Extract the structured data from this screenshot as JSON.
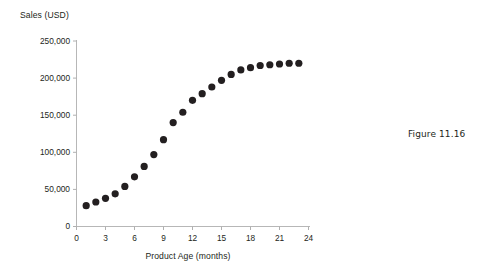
{
  "figure": {
    "caption": "Figure 11.16"
  },
  "chart_data": {
    "type": "scatter",
    "title": "",
    "subtitle": "",
    "xlabel": "Product Age (months)",
    "ylabel": "Sales (USD)",
    "xlim": [
      0,
      24
    ],
    "ylim": [
      0,
      250000
    ],
    "xticks": [
      0,
      3,
      6,
      9,
      12,
      15,
      18,
      21,
      24
    ],
    "xtick_labels": [
      "0",
      "3",
      "6",
      "9",
      "12",
      "15",
      "18",
      "21",
      "24"
    ],
    "yticks": [
      0,
      50000,
      100000,
      150000,
      200000,
      250000
    ],
    "ytick_labels": [
      "0",
      "50,000",
      "100,000",
      "150,000",
      "200,000",
      "250,000"
    ],
    "grid": false,
    "legend": false,
    "legend_position": "none",
    "marker": "circle",
    "marker_color": "#231f20",
    "marker_size": 5,
    "axis_color": "#b0b0b0",
    "x": [
      1,
      2,
      3,
      4,
      5,
      6,
      7,
      8,
      9,
      10,
      11,
      12,
      13,
      14,
      15,
      16,
      17,
      18,
      19,
      20,
      21,
      22,
      23
    ],
    "values": [
      28000,
      33000,
      38000,
      44000,
      54000,
      67000,
      81000,
      97000,
      117000,
      140000,
      154000,
      170000,
      179000,
      188000,
      197000,
      205000,
      211000,
      214000,
      217000,
      218000,
      219000,
      220000,
      220000
    ],
    "series": [
      {
        "name": "Sales (USD)",
        "values": [
          28000,
          33000,
          38000,
          44000,
          54000,
          67000,
          81000,
          97000,
          117000,
          140000,
          154000,
          170000,
          179000,
          188000,
          197000,
          205000,
          211000,
          214000,
          217000,
          218000,
          219000,
          220000,
          220000
        ]
      }
    ],
    "annotations": []
  }
}
